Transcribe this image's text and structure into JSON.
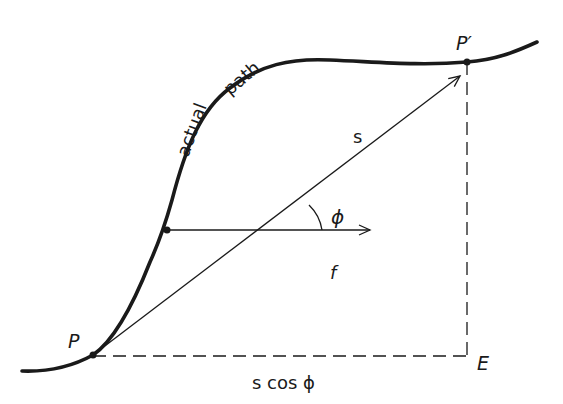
{
  "diagram": {
    "type": "physics-work-path",
    "colors": {
      "ink": "#1a1a1a",
      "background": "#ffffff"
    },
    "labels": {
      "start_point": "P",
      "end_point": "P′",
      "corner_point": "E",
      "path_word_1": "actual",
      "path_word_2": "path",
      "displacement": "s",
      "force": "f",
      "angle": "ϕ",
      "projection": "s cos ϕ"
    },
    "elements": [
      {
        "name": "actual-path-curve",
        "style": "thick solid",
        "from": "P",
        "to": "P′"
      },
      {
        "name": "displacement-vector",
        "style": "thin arrow",
        "from": "P",
        "to": "P′",
        "label": "s"
      },
      {
        "name": "force-vector",
        "style": "thin arrow",
        "origin": "point on path",
        "direction": "horizontal",
        "label": "f"
      },
      {
        "name": "angle-arc",
        "between": [
          "f",
          "s"
        ],
        "label": "ϕ"
      },
      {
        "name": "projection-line",
        "style": "dashed",
        "from": "P",
        "to": "E",
        "label": "s cos ϕ"
      },
      {
        "name": "vertical-drop-line",
        "style": "dashed",
        "from": "P′",
        "to": "E"
      }
    ]
  }
}
